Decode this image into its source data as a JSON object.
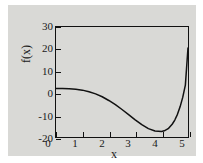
{
  "chart_data": {
    "type": "line",
    "title": "",
    "xlabel": "x",
    "ylabel": "f(x)",
    "xlim": [
      0,
      5
    ],
    "ylim": [
      -20,
      30
    ],
    "xticks": [
      "0",
      "1",
      "2",
      "3",
      "4",
      "5"
    ],
    "yticks": [
      "30",
      "20",
      "10",
      "0",
      "-10",
      "-20"
    ],
    "grid": false,
    "legend": null,
    "series": [
      {
        "name": "f(x)",
        "color": "#111111",
        "x": [
          0.0,
          0.25,
          0.5,
          0.75,
          1.0,
          1.25,
          1.5,
          1.75,
          2.0,
          2.25,
          2.5,
          2.75,
          3.0,
          3.25,
          3.5,
          3.75,
          4.0,
          4.1,
          4.25,
          4.4,
          4.5,
          4.6,
          4.7,
          4.8,
          4.9,
          5.0
        ],
        "y": [
          2.0,
          2.0,
          1.9,
          1.7,
          1.3,
          0.6,
          -0.4,
          -1.7,
          -3.4,
          -5.3,
          -7.5,
          -9.8,
          -12.2,
          -14.4,
          -16.2,
          -17.3,
          -17.5,
          -17.2,
          -16.2,
          -14.2,
          -12.3,
          -9.7,
          -6.3,
          -2.0,
          3.6,
          20.5
        ]
      }
    ],
    "annotations": {
      "minimum_x": 4.0,
      "minimum_y": -17.5,
      "f_at_zero": 2.0,
      "f_at_five": 20.5
    }
  },
  "figure": {
    "background_color": "#d9d9d6",
    "page_color": "#ffffff",
    "axis_color": "#111111",
    "curve_color": "#111111"
  }
}
